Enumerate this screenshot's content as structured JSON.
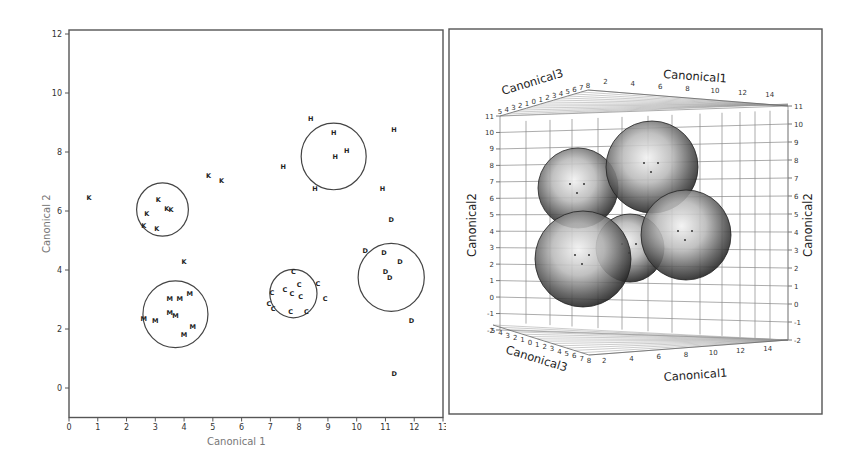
{
  "chart_data": [
    {
      "type": "scatter",
      "title": "",
      "xlabel": "Canonical 1",
      "ylabel": "Canonical 2",
      "xlim": [
        0,
        13
      ],
      "ylim": [
        -1,
        12
      ],
      "x_ticks": [
        0,
        1,
        2,
        3,
        4,
        5,
        6,
        7,
        8,
        9,
        10,
        11,
        12,
        13
      ],
      "y_ticks": [
        0,
        2,
        4,
        6,
        8,
        10,
        12
      ],
      "grid": false,
      "legend": null,
      "marker": "group letter",
      "series": [
        {
          "name": "K",
          "points": [
            [
              0.7,
              6.45
            ],
            [
              3.1,
              6.4
            ],
            [
              2.7,
              5.9
            ],
            [
              3.4,
              6.1
            ],
            [
              3.55,
              6.05
            ],
            [
              2.6,
              5.5
            ],
            [
              3.05,
              5.4
            ],
            [
              4.85,
              7.2
            ],
            [
              5.3,
              7.05
            ],
            [
              4.0,
              4.3
            ]
          ]
        },
        {
          "name": "H",
          "points": [
            [
              8.4,
              9.15
            ],
            [
              9.2,
              8.65
            ],
            [
              9.65,
              8.05
            ],
            [
              9.25,
              7.85
            ],
            [
              11.3,
              8.75
            ],
            [
              7.45,
              7.5
            ],
            [
              8.55,
              6.75
            ],
            [
              10.9,
              6.75
            ]
          ]
        },
        {
          "name": "D",
          "points": [
            [
              11.2,
              5.7
            ],
            [
              10.3,
              4.65
            ],
            [
              10.95,
              4.6
            ],
            [
              11.5,
              4.3
            ],
            [
              11.0,
              3.95
            ],
            [
              11.15,
              3.75
            ],
            [
              11.9,
              2.3
            ],
            [
              11.3,
              0.5
            ]
          ]
        },
        {
          "name": "C",
          "points": [
            [
              7.8,
              3.95
            ],
            [
              8.0,
              3.5
            ],
            [
              8.65,
              3.55
            ],
            [
              7.5,
              3.35
            ],
            [
              7.05,
              3.25
            ],
            [
              7.75,
              3.2
            ],
            [
              8.05,
              3.1
            ],
            [
              6.95,
              2.85
            ],
            [
              7.1,
              2.7
            ],
            [
              7.7,
              2.6
            ],
            [
              8.25,
              2.6
            ],
            [
              8.9,
              3.05
            ]
          ]
        },
        {
          "name": "M",
          "points": [
            [
              3.5,
              3.05
            ],
            [
              3.85,
              3.05
            ],
            [
              4.2,
              3.2
            ],
            [
              3.5,
              2.55
            ],
            [
              3.7,
              2.45
            ],
            [
              2.6,
              2.35
            ],
            [
              3.0,
              2.3
            ],
            [
              4.3,
              2.1
            ],
            [
              4.0,
              1.8
            ]
          ]
        }
      ],
      "circles": [
        {
          "group": "K",
          "cx": 3.25,
          "cy": 6.05,
          "r": 0.9
        },
        {
          "group": "H",
          "cx": 9.2,
          "cy": 7.85,
          "r": 1.13
        },
        {
          "group": "D",
          "cx": 11.2,
          "cy": 3.75,
          "r": 1.15
        },
        {
          "group": "C",
          "cx": 7.8,
          "cy": 3.2,
          "r": 0.82
        },
        {
          "group": "M",
          "cx": 3.7,
          "cy": 2.5,
          "r": 1.13
        }
      ]
    },
    {
      "type": "scatter3d",
      "title": "",
      "axes": {
        "x": {
          "label": "Canonical1",
          "ticks": [
            2,
            4,
            6,
            8,
            10,
            12,
            14
          ]
        },
        "y": {
          "label": "Canonical2",
          "ticks": [
            -2,
            -1,
            0,
            1,
            2,
            3,
            4,
            5,
            6,
            7,
            8,
            9,
            10,
            11
          ]
        },
        "z": {
          "label": "Canonical3",
          "ticks": [
            -5,
            -4,
            -3,
            -2,
            -1,
            0,
            1,
            2,
            3,
            4,
            5,
            6,
            7,
            8
          ]
        }
      },
      "grid": true,
      "spheres": [
        {
          "name": "upper-left",
          "cx": 578,
          "cy": 188,
          "r": 40
        },
        {
          "name": "top-center",
          "cx": 652,
          "cy": 167,
          "r": 46
        },
        {
          "name": "middle-back",
          "cx": 630,
          "cy": 248,
          "r": 34
        },
        {
          "name": "right",
          "cx": 686,
          "cy": 235,
          "r": 45
        },
        {
          "name": "lower-left",
          "cx": 583,
          "cy": 259,
          "r": 48
        }
      ]
    }
  ],
  "left": {
    "xlabel": "Canonical 1",
    "ylabel": "Canonical 2"
  },
  "right": {
    "top_x_label": "Canonical1",
    "top_z_label": "Canonical3",
    "bottom_x_label": "Canonical1",
    "bottom_z_label": "Canonical3",
    "left_y_label": "Canonical2",
    "right_y_label": "Canonical2"
  }
}
